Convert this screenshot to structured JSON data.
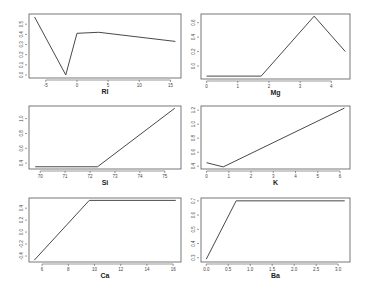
{
  "chart_data": [
    {
      "type": "line",
      "title": "",
      "xlabel": "RI",
      "ylabel": "",
      "x": [
        -6.8,
        -1.8,
        0.0,
        3.5,
        15.8
      ],
      "values": [
        0.57,
        0.0,
        0.41,
        0.42,
        0.33
      ],
      "xlim": [
        -7.7,
        16.7
      ],
      "ylim": [
        -0.03,
        0.6
      ],
      "xticks": [
        -5,
        0,
        5,
        10,
        15
      ],
      "yticks": [
        0.0,
        0.1,
        0.2,
        0.3,
        0.4,
        0.5
      ],
      "ytick_labels": [
        "0.0",
        "0.1",
        "0.2",
        "0.3",
        "0.4",
        "0.5"
      ],
      "grid": false
    },
    {
      "type": "line",
      "title": "",
      "xlabel": "Mg",
      "ylabel": "",
      "x": [
        0.0,
        1.75,
        3.45,
        4.45
      ],
      "values": [
        0.06,
        0.06,
        0.89,
        0.4
      ],
      "xlim": [
        -0.18,
        4.6
      ],
      "ylim": [
        0.02,
        0.92
      ],
      "xticks": [
        0,
        1,
        2,
        3,
        4
      ],
      "yticks": [
        0.2,
        0.4,
        0.6,
        0.8,
        1.0
      ],
      "ytick_labels": [
        "0.0",
        "0.2",
        "0.4",
        "0.6",
        "0.8"
      ],
      "grid": false
    },
    {
      "type": "line",
      "title": "",
      "xlabel": "Si",
      "ylabel": "",
      "x": [
        69.8,
        72.3,
        75.4
      ],
      "values": [
        0.35,
        0.35,
        1.14
      ],
      "xlim": [
        69.55,
        75.65
      ],
      "ylim": [
        0.32,
        1.17
      ],
      "xticks": [
        70,
        71,
        72,
        73,
        74,
        75
      ],
      "yticks": [
        0.4,
        0.6,
        0.8,
        1.0
      ],
      "ytick_labels": [
        "0.4",
        "0.6",
        "0.8",
        "1.0"
      ],
      "grid": false
    },
    {
      "type": "line",
      "title": "",
      "xlabel": "K",
      "ylabel": "",
      "x": [
        0.0,
        0.75,
        6.2
      ],
      "values": [
        0.45,
        0.39,
        1.23
      ],
      "xlim": [
        -0.25,
        6.45
      ],
      "ylim": [
        0.36,
        1.26
      ],
      "xticks": [
        0,
        1,
        2,
        3,
        4,
        5,
        6
      ],
      "yticks": [
        0.4,
        0.6,
        0.8,
        1.0,
        1.2
      ],
      "ytick_labels": [
        "0.4",
        "0.6",
        "0.8",
        "1.0",
        "1.2"
      ],
      "grid": false
    },
    {
      "type": "line",
      "title": "",
      "xlabel": "Ca",
      "ylabel": "",
      "x": [
        5.4,
        9.6,
        16.2
      ],
      "values": [
        -0.47,
        0.53,
        0.53
      ],
      "xlim": [
        5.0,
        16.6
      ],
      "ylim": [
        -0.5,
        0.57
      ],
      "xticks": [
        6,
        8,
        10,
        12,
        14,
        16
      ],
      "yticks": [
        -0.4,
        -0.2,
        0.0,
        0.2,
        0.4
      ],
      "ytick_labels": [
        "-0.4",
        "-0.2",
        "0.0",
        "0.2",
        "0.4"
      ],
      "grid": false
    },
    {
      "type": "line",
      "title": "",
      "xlabel": "Ba",
      "ylabel": "",
      "x": [
        0.0,
        0.68,
        3.15
      ],
      "values": [
        0.29,
        0.7,
        0.7
      ],
      "xlim": [
        -0.12,
        3.27
      ],
      "ylim": [
        0.27,
        0.72
      ],
      "xticks": [
        0.0,
        0.5,
        1.0,
        1.5,
        2.0,
        2.5,
        3.0
      ],
      "xtick_labels": [
        "0.0",
        "0.5",
        "1.0",
        "1.5",
        "2.0",
        "2.5",
        "3.0"
      ],
      "yticks": [
        0.3,
        0.4,
        0.5,
        0.6,
        0.7
      ],
      "ytick_labels": [
        "0.3",
        "0.4",
        "0.5",
        "0.6",
        "0.7"
      ],
      "grid": false
    }
  ],
  "layout": {
    "panels": [
      {
        "x0": 29,
        "x1": 181,
        "y0": 14,
        "y1": 78
      },
      {
        "x0": 201,
        "x1": 350,
        "y0": 14,
        "y1": 79
      },
      {
        "x0": 29,
        "x1": 181,
        "y0": 106,
        "y1": 169
      },
      {
        "x0": 201,
        "x1": 350,
        "y0": 106,
        "y1": 169
      },
      {
        "x0": 29,
        "x1": 181,
        "y0": 198,
        "y1": 262
      },
      {
        "x0": 201,
        "x1": 350,
        "y0": 198,
        "y1": 262
      }
    ]
  }
}
